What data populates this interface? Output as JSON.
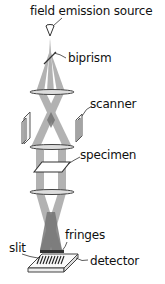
{
  "diagram": {
    "type": "electron holography microscope schematic",
    "labels": {
      "source": "field emission source",
      "biprism": "biprism",
      "scanner": "scanner",
      "specimen": "specimen",
      "fringes": "fringes",
      "slit": "slit",
      "detector": "detector"
    },
    "colors": {
      "beam": "#9a9a9a",
      "beam_overlap": "#6e6e6e",
      "outline": "#444444",
      "text": "#111111",
      "background": "#ffffff"
    }
  }
}
